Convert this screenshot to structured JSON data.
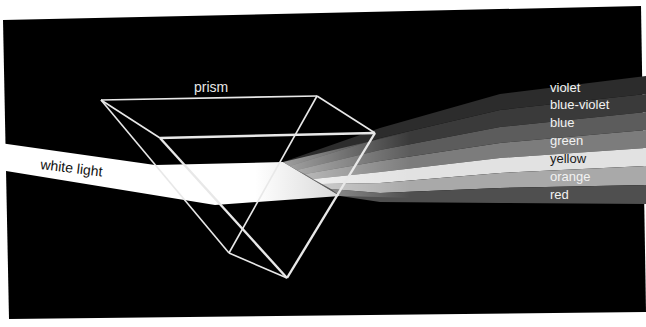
{
  "diagram": {
    "labels": {
      "prism": "prism",
      "white_light": "white light"
    },
    "spectrum": [
      {
        "name": "violet",
        "color": "#2c2c2c",
        "text_color": "#f2f2f2"
      },
      {
        "name": "blue-violet",
        "color": "#3a3a3a",
        "text_color": "#f2f2f2"
      },
      {
        "name": "blue",
        "color": "#5c5c5c",
        "text_color": "#f2f2f2"
      },
      {
        "name": "green",
        "color": "#7c7c7c",
        "text_color": "#f2f2f2"
      },
      {
        "name": "yellow",
        "color": "#e2e2e2",
        "text_color": "#1a1a1a"
      },
      {
        "name": "orange",
        "color": "#a9a9a9",
        "text_color": "#f2f2f2"
      },
      {
        "name": "red",
        "color": "#4f4f4f",
        "text_color": "#f2f2f2"
      }
    ],
    "colors": {
      "background": "#000000",
      "page": "#ffffff",
      "prism_edges": "#e8e8e8",
      "white_beam": "#ffffff"
    }
  }
}
